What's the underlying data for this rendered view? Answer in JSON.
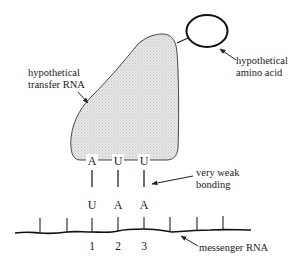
{
  "labels": {
    "trna_line1": "hypothetical",
    "trna_line2": "transfer RNA",
    "amino_line1": "hypothetical",
    "amino_line2": "amino acid",
    "bond_line1": "very weak",
    "bond_line2": "bonding",
    "mrna": "messenger RNA"
  },
  "anticodon": [
    "A",
    "U",
    "U"
  ],
  "codon": [
    "U",
    "A",
    "A"
  ],
  "positions": [
    "1",
    "2",
    "3"
  ],
  "colors": {
    "stroke": "#222222",
    "trna_fill": "#e3e3e3",
    "background": "#ffffff"
  }
}
